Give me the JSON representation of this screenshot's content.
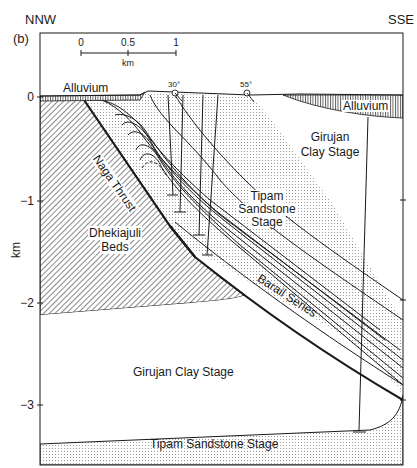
{
  "figure": {
    "panel_label": "(b)",
    "direction_left": "NNW",
    "direction_right": "SSE",
    "y_axis_label": "km",
    "y_ticks": [
      "0",
      "−1",
      "−2",
      "−3"
    ],
    "scale_bar": {
      "ticks": [
        "0",
        "0.5",
        "1"
      ],
      "unit": "km"
    },
    "dip_markers": [
      "30°",
      "55°"
    ]
  },
  "units": {
    "alluvium_left": "Alluvium",
    "alluvium_right": "Alluvium",
    "girujan_upper_line1": "Girujan",
    "girujan_upper_line2": "Clay Stage",
    "tipam_line1": "Tipam",
    "tipam_line2": "Sandstone",
    "tipam_line3": "Stage",
    "dhekiajuli_line1": "Dhekiajuli",
    "dhekiajuli_line2": "Beds",
    "naga_thrust": "Naga Thrust",
    "barail": "Barail Series",
    "girujan_lower": "Girujan Clay Stage",
    "tipam_lower": "Tipam Sandstone Stage"
  },
  "colors": {
    "line": "#1a1a1a",
    "stipple": "#9a9a9a",
    "hatch": "#4a4a4a",
    "background": "#ffffff"
  }
}
